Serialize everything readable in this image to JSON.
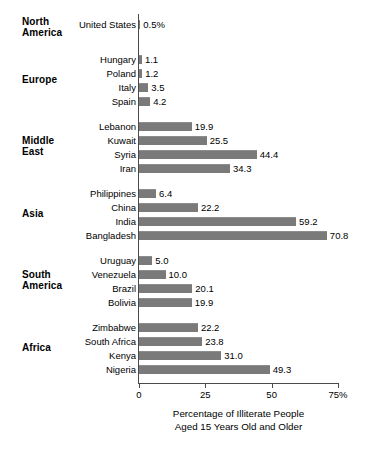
{
  "chart_data": {
    "type": "bar",
    "orientation": "horizontal",
    "title": "",
    "xlabel": "Percentage of Illiterate People Aged 15 Years Old and Older",
    "ylabel": "",
    "xlim": [
      0,
      75
    ],
    "xticks": [
      0,
      25,
      50,
      75
    ],
    "xtick_labels": [
      "0",
      "25",
      "50",
      "75%"
    ],
    "grid": false,
    "legend": null,
    "bar_color": "#7a7a7a",
    "categories": [
      "United States",
      "Hungary",
      "Poland",
      "Italy",
      "Spain",
      "Lebanon",
      "Kuwait",
      "Syria",
      "Iran",
      "Philippines",
      "China",
      "India",
      "Bangladesh",
      "Uruguay",
      "Venezuela",
      "Brazil",
      "Bolivia",
      "Zimbabwe",
      "South Africa",
      "Kenya",
      "Nigeria"
    ],
    "values": [
      0.5,
      1.1,
      1.2,
      3.5,
      4.2,
      19.9,
      25.5,
      44.4,
      34.3,
      6.4,
      22.2,
      59.2,
      70.8,
      5.0,
      10.0,
      20.1,
      19.9,
      22.2,
      23.8,
      31.0,
      49.3
    ],
    "value_labels": [
      "0.5%",
      "1.1",
      "1.2",
      "3.5",
      "4.2",
      "19.9",
      "25.5",
      "44.4",
      "34.3",
      "6.4",
      "22.2",
      "59.2",
      "70.8",
      "5.0",
      "10.0",
      "20.1",
      "19.9",
      "22.2",
      "23.8",
      "31.0",
      "49.3"
    ],
    "groups": [
      {
        "region": "North\nAmerica",
        "items": [
          {
            "label": "United States",
            "value": 0.5,
            "value_label": "0.5%",
            "top": 18
          }
        ],
        "label_top": 16
      },
      {
        "region": "Europe",
        "items": [
          {
            "label": "Hungary",
            "value": 1.1,
            "value_label": "1.1",
            "top": 53
          },
          {
            "label": "Poland",
            "value": 1.2,
            "value_label": "1.2",
            "top": 67
          },
          {
            "label": "Italy",
            "value": 3.5,
            "value_label": "3.5",
            "top": 81
          },
          {
            "label": "Spain",
            "value": 4.2,
            "value_label": "4.2",
            "top": 95
          }
        ],
        "label_top": 74
      },
      {
        "region": "Middle\nEast",
        "items": [
          {
            "label": "Lebanon",
            "value": 19.9,
            "value_label": "19.9",
            "top": 120
          },
          {
            "label": "Kuwait",
            "value": 25.5,
            "value_label": "25.5",
            "top": 134
          },
          {
            "label": "Syria",
            "value": 44.4,
            "value_label": "44.4",
            "top": 148
          },
          {
            "label": "Iran",
            "value": 34.3,
            "value_label": "34.3",
            "top": 162
          }
        ],
        "label_top": 135
      },
      {
        "region": "Asia",
        "items": [
          {
            "label": "Philippines",
            "value": 6.4,
            "value_label": "6.4",
            "top": 187
          },
          {
            "label": "China",
            "value": 22.2,
            "value_label": "22.2",
            "top": 201
          },
          {
            "label": "India",
            "value": 59.2,
            "value_label": "59.2",
            "top": 215
          },
          {
            "label": "Bangladesh",
            "value": 70.8,
            "value_label": "70.8",
            "top": 229
          }
        ],
        "label_top": 208
      },
      {
        "region": "South\nAmerica",
        "items": [
          {
            "label": "Uruguay",
            "value": 5.0,
            "value_label": "5.0",
            "top": 254
          },
          {
            "label": "Venezuela",
            "value": 10.0,
            "value_label": "10.0",
            "top": 268
          },
          {
            "label": "Brazil",
            "value": 20.1,
            "value_label": "20.1",
            "top": 282
          },
          {
            "label": "Bolivia",
            "value": 19.9,
            "value_label": "19.9",
            "top": 296
          }
        ],
        "label_top": 269
      },
      {
        "region": "Africa",
        "items": [
          {
            "label": "Zimbabwe",
            "value": 22.2,
            "value_label": "22.2",
            "top": 321
          },
          {
            "label": "South Africa",
            "value": 23.8,
            "value_label": "23.8",
            "top": 335
          },
          {
            "label": "Kenya",
            "value": 31.0,
            "value_label": "31.0",
            "top": 349
          },
          {
            "label": "Nigeria",
            "value": 49.3,
            "value_label": "49.3",
            "top": 363
          }
        ],
        "label_top": 342
      }
    ],
    "caption_lines": [
      "Percentage of Illiterate People",
      "Aged 15 Years Old and Older"
    ]
  }
}
